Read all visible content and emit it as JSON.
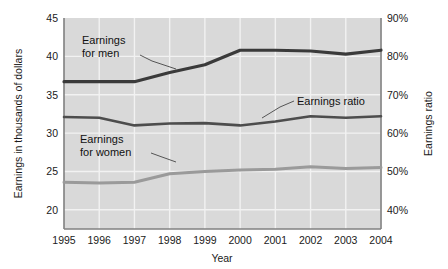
{
  "chart_data": {
    "type": "line",
    "title": "",
    "subtitle": "",
    "xlabel": "Year",
    "ylabel": "Earnings in thousands of dollars",
    "y2label": "Earnings ratio",
    "grid": true,
    "legend_position": "inline-annotations",
    "x": [
      1995,
      1996,
      1997,
      1998,
      1999,
      2000,
      2001,
      2002,
      2003,
      2004
    ],
    "categories": [
      "1995",
      "1996",
      "1997",
      "1998",
      "1999",
      "2000",
      "2001",
      "2002",
      "2003",
      "2004"
    ],
    "xtick_labels": [
      "1995",
      "1996",
      "1997",
      "1998",
      "1999",
      "2000",
      "2001",
      "2002",
      "2003",
      "2004"
    ],
    "ytick_labels": [
      "45",
      "40",
      "35",
      "30",
      "25",
      "20"
    ],
    "ytick_values": [
      45,
      40,
      35,
      30,
      25,
      20
    ],
    "ylim": [
      17.5,
      45
    ],
    "y2tick_labels": [
      "90%",
      "80%",
      "70%",
      "60%",
      "50%",
      "40%"
    ],
    "y2tick_values": [
      90,
      80,
      70,
      60,
      50,
      40
    ],
    "y2lim": [
      35,
      90
    ],
    "series": [
      {
        "name": "Earnings for men",
        "axis": "left",
        "color": "#3a3a3a",
        "values": [
          36.7,
          36.7,
          36.7,
          37.9,
          38.9,
          40.8,
          40.8,
          40.7,
          40.3,
          40.8
        ]
      },
      {
        "name": "Earnings ratio",
        "axis": "right",
        "color": "#4d4d4d",
        "values": [
          64.2,
          64.0,
          62.0,
          62.5,
          62.6,
          62.0,
          63.0,
          64.4,
          64.0,
          64.4
        ]
      },
      {
        "name": "Earnings for women",
        "axis": "left",
        "color": "#9a9a9a",
        "values": [
          23.6,
          23.5,
          23.6,
          24.7,
          25.0,
          25.2,
          25.3,
          25.6,
          25.4,
          25.5
        ]
      }
    ],
    "annotations": [
      {
        "id": "men",
        "line1": "Earnings",
        "line2": "for men"
      },
      {
        "id": "ratio",
        "line1": "Earnings ratio",
        "line2": ""
      },
      {
        "id": "women",
        "line1": "Earnings",
        "line2": "for women"
      }
    ],
    "colors": {
      "plot_background": "#d9d9d9",
      "gridline": "#f2f2f2",
      "axis_line": "#808080",
      "text": "#1a1a1a",
      "men_line": "#3a3a3a",
      "ratio_line": "#4d4d4d",
      "women_line": "#9a9a9a"
    }
  }
}
